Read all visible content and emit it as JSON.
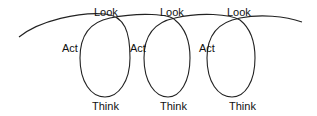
{
  "diagram": {
    "type": "spiral-cycle",
    "stages": [
      "Look",
      "Think",
      "Act"
    ],
    "loops": [
      {
        "look": "Look",
        "think": "Think",
        "act": "Act"
      },
      {
        "look": "Look",
        "think": "Think",
        "act": "Act"
      },
      {
        "look": "Look",
        "think": "Think",
        "act": "Act"
      }
    ],
    "stroke_color": "#222222",
    "text_color": "#111111"
  }
}
